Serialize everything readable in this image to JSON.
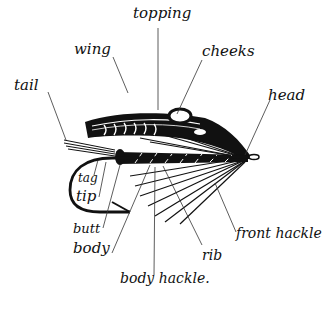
{
  "diagram": {
    "ink_color": "#111111",
    "background": "#ffffff",
    "labels": {
      "topping": "topping",
      "wing": "wing",
      "cheeks": "cheeks",
      "tail": "tail",
      "head": "head",
      "tag": "tag",
      "tip": "tip",
      "butt": "butt",
      "body": "body",
      "rib": "rib",
      "front_hackle": "front hackle",
      "body_hackle": "body hackle."
    }
  }
}
